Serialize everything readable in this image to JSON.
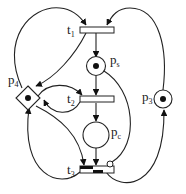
{
  "diagram": {
    "type": "petri-net",
    "places": [
      {
        "id": "ps",
        "label": "p",
        "sub": "s",
        "tokens": 1,
        "shape": "circle"
      },
      {
        "id": "pc",
        "label": "p",
        "sub": "c",
        "tokens": 0,
        "shape": "circle"
      },
      {
        "id": "p3",
        "label": "p",
        "sub": "3",
        "tokens": 1,
        "shape": "circle"
      },
      {
        "id": "p4",
        "label": "p",
        "sub": "4",
        "tokens": 1,
        "shape": "diamond"
      }
    ],
    "transitions": [
      {
        "id": "t1",
        "label": "t",
        "sub": "1"
      },
      {
        "id": "t2",
        "label": "t",
        "sub": "2"
      },
      {
        "id": "t3",
        "label": "t",
        "sub": "3"
      }
    ],
    "arcs": [
      {
        "from": "p4",
        "to": "t1"
      },
      {
        "from": "p3",
        "to": "t1"
      },
      {
        "from": "t1",
        "to": "ps"
      },
      {
        "from": "t1",
        "to": "p4"
      },
      {
        "from": "ps",
        "to": "t2"
      },
      {
        "from": "p4",
        "to": "t2"
      },
      {
        "from": "t2",
        "to": "p4"
      },
      {
        "from": "t2",
        "to": "pc"
      },
      {
        "from": "ps",
        "to": "t3",
        "type": "inhibitor"
      },
      {
        "from": "pc",
        "to": "t3"
      },
      {
        "from": "p4",
        "to": "t3"
      },
      {
        "from": "t3",
        "to": "p4"
      },
      {
        "from": "t3",
        "to": "p3"
      }
    ]
  }
}
